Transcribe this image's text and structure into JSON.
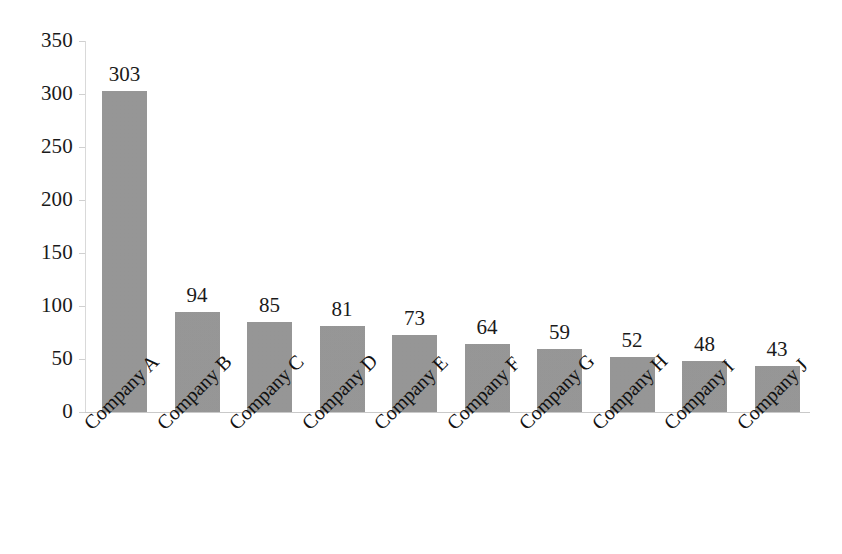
{
  "chart_data": {
    "type": "bar",
    "title": "",
    "subtitle": "",
    "xlabel": "",
    "ylabel": "",
    "categories": [
      "Company A",
      "Company B",
      "Company C",
      "Company D",
      "Company E",
      "Company F",
      "Company G",
      "Company H",
      "Company I",
      "Company J"
    ],
    "values": [
      303,
      94,
      85,
      81,
      73,
      64,
      59,
      52,
      48,
      43
    ],
    "value_labels": [
      "303",
      "94",
      "85",
      "81",
      "73",
      "64",
      "59",
      "52",
      "48",
      "43"
    ],
    "ylim": [
      0,
      350
    ],
    "yticks": [
      0,
      50,
      100,
      150,
      200,
      250,
      300,
      350
    ],
    "ytick_labels": [
      "0",
      "50",
      "100",
      "150",
      "200",
      "250",
      "300",
      "350"
    ],
    "grid": false,
    "legend": null,
    "bar_color": "#969696",
    "axis_color": "#d0d0d0",
    "text_color": "#1a1a1a",
    "background_color": "#ffffff",
    "category_label_rotation": -45
  }
}
